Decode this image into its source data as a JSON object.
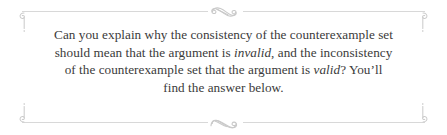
{
  "callout": {
    "text_lines": [
      {
        "segments": [
          {
            "text": "Can you explain why the consistency of the counterexample set",
            "style": "normal"
          }
        ]
      },
      {
        "segments": [
          {
            "text": "should mean that the argument is ",
            "style": "normal"
          },
          {
            "text": "invalid",
            "style": "italic"
          },
          {
            "text": ", and the inconsistency",
            "style": "normal"
          }
        ]
      },
      {
        "segments": [
          {
            "text": "of the counterexample set that the argument is ",
            "style": "normal"
          },
          {
            "text": "valid",
            "style": "italic"
          },
          {
            "text": "? You’ll",
            "style": "normal"
          }
        ]
      },
      {
        "segments": [
          {
            "text": "find the answer below.",
            "style": "normal"
          }
        ]
      }
    ],
    "full_text": "Can you explain why the consistency of the counterexample set should mean that the argument is invalid, and the inconsistency of the counterexample set that the argument is valid? You’ll find the answer below.",
    "emphasis_words": [
      "invalid",
      "valid"
    ],
    "ornaments": {
      "top_center": "swirl-flourish-ornament",
      "bottom_center": "swirl-flourish-ornament",
      "corner_top_left": "curl-ornament",
      "corner_top_right": "curl-ornament",
      "corner_bottom_left": "curl-ornament",
      "corner_bottom_right": "curl-ornament"
    },
    "colors": {
      "text": "#3a3a3a",
      "rule": "#d8d8d8",
      "ornament": "#cfcfcf",
      "background": "#ffffff"
    }
  }
}
